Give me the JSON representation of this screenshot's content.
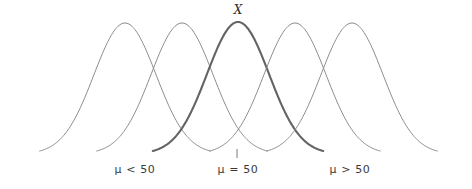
{
  "figure": {
    "background_color": "#ffffff",
    "width": 472,
    "height": 189,
    "variable_label": "X",
    "tick_mark": {
      "name": "center-tick",
      "x": 237,
      "y_top": 149,
      "y_bottom": 158,
      "color": "#7a7a7a"
    },
    "labels": {
      "left": "μ < 50",
      "center": "μ = 50",
      "right": "μ > 50"
    }
  },
  "chart_data": {
    "type": "line",
    "title": "",
    "subtitle": "",
    "xlabel": "",
    "ylabel": "",
    "grid": false,
    "legend_position": "none",
    "annotations": [
      {
        "text": "X",
        "x": 238,
        "y": 10,
        "style": "italic"
      },
      {
        "text": "μ < 50",
        "x": 135,
        "y": 170,
        "style": "normal"
      },
      {
        "text": "μ = 50",
        "x": 238,
        "y": 170,
        "style": "normal"
      },
      {
        "text": "μ > 50",
        "x": 350,
        "y": 170,
        "style": "normal"
      }
    ],
    "axis_ranges": {
      "xlim": [
        40,
        440
      ],
      "ylim": [
        0,
        1
      ]
    },
    "baseline_y": 154,
    "peak_y": 23,
    "sigma_px": 31,
    "series": [
      {
        "name": "curve-1",
        "mean_px": 125,
        "peak_y_px": 23,
        "color": "#8c8c8c",
        "width": 1,
        "highlighted": false
      },
      {
        "name": "curve-2",
        "mean_px": 182,
        "peak_y_px": 23,
        "color": "#8c8c8c",
        "width": 1,
        "highlighted": false
      },
      {
        "name": "curve-3",
        "mean_px": 238,
        "peak_y_px": 22,
        "color": "#646464",
        "width": 2.1,
        "highlighted": true
      },
      {
        "name": "curve-4",
        "mean_px": 295,
        "peak_y_px": 23,
        "color": "#8c8c8c",
        "width": 1,
        "highlighted": false
      },
      {
        "name": "curve-5",
        "mean_px": 352,
        "peak_y_px": 23,
        "color": "#8c8c8c",
        "width": 1,
        "highlighted": false
      }
    ]
  }
}
